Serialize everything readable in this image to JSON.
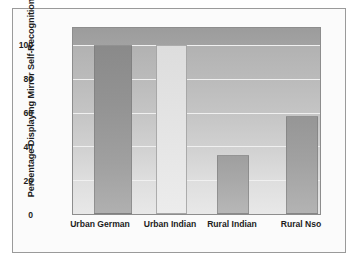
{
  "figure": {
    "frame_color": "#9a9a9a",
    "background": "#ffffff"
  },
  "chart_data": {
    "type": "bar",
    "title": "",
    "xlabel": "",
    "ylabel": "Percentage Displaying Mirror Self-Recognition",
    "categories": [
      "Urban German",
      "Urban Indian",
      "Rural Indian",
      "Rural Nso"
    ],
    "values": [
      100,
      100,
      35,
      58
    ],
    "series": [
      {
        "name": "Percentage Displaying Mirror Self-Recognition",
        "values": [
          100,
          100,
          35,
          58
        ]
      }
    ],
    "ylim": [
      0,
      110
    ],
    "yticks": [
      0,
      20,
      40,
      60,
      80,
      100
    ],
    "ytick_labels": [
      "0",
      "20",
      "40",
      "60",
      "80",
      "100"
    ],
    "grid": true,
    "gridline_color": "#f0f0f0",
    "legend": "none",
    "bar_colors": [
      "#8e8e8e",
      "#e2e2e2",
      "#a6a6a6",
      "#9e9e9e"
    ],
    "plot_background": "#c6c6c6",
    "axis_color": "#8d8d8d"
  }
}
